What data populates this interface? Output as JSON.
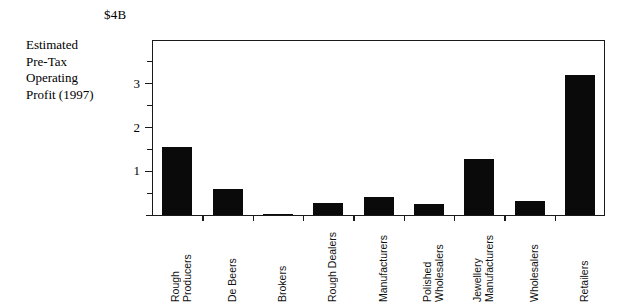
{
  "chart_data": {
    "type": "bar",
    "title": "",
    "subtitle": "",
    "unit_caption": "$4B",
    "ylabel_lines": [
      "Estimated",
      "Pre-Tax",
      "Operating",
      "Profit (1997)"
    ],
    "ylabel": "Estimated Pre-Tax Operating Profit (1997)",
    "xlabel": "",
    "ylim": [
      0,
      4
    ],
    "ytick_labels": [
      "1",
      "2",
      "3"
    ],
    "ytick_values": [
      1,
      2,
      3
    ],
    "yminor_values": [
      0.5,
      1.5,
      2.5,
      3.5
    ],
    "grid": false,
    "legend": "none",
    "categories": [
      "Rough Producers",
      "De Beers",
      "Brokers",
      "Rough Dealers",
      "Manufacturers",
      "Polished Wholesalers",
      "Jewellery Manufacturers",
      "Wholesalers",
      "Retailers"
    ],
    "category_lines": [
      [
        "Rough",
        "Producers"
      ],
      [
        "De Beers"
      ],
      [
        "Brokers"
      ],
      [
        "Rough Dealers"
      ],
      [
        "Manufacturers"
      ],
      [
        "Polished",
        "Wholesalers"
      ],
      [
        "Jewellery",
        "Manufacturers"
      ],
      [
        "Wholesalers"
      ],
      [
        "Retailers"
      ]
    ],
    "values": [
      1.56,
      0.6,
      0.03,
      0.28,
      0.42,
      0.25,
      1.27,
      0.33,
      3.2
    ],
    "bar_color": "#0a0a0a",
    "axis_color": "#1a1a1a"
  }
}
